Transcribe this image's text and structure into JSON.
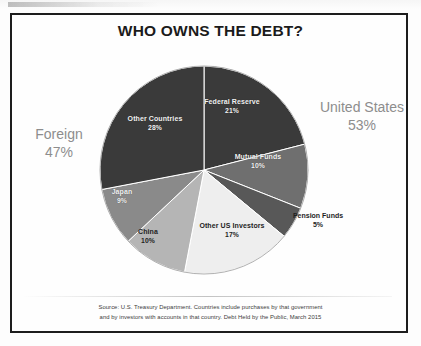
{
  "figure": {
    "title": "WHO OWNS THE DEBT?",
    "source_line1": "Source: U.S. Treasury Department. Countries include purchases by that government",
    "source_line2": "and by investors with accounts in that country. Debt Held by the Public, March 2015"
  },
  "groups": [
    {
      "name": "United States",
      "label": "United States",
      "pct": "53%",
      "color": "#8d8d8d"
    },
    {
      "name": "Foreign",
      "label": "Foreign",
      "pct": "47%",
      "color": "#8d8d8d"
    }
  ],
  "chart_data": {
    "type": "pie",
    "title": "WHO OWNS THE DEBT?",
    "units": "percent of debt held by the public",
    "start_angle_deg": 0,
    "direction": "clockwise",
    "legend": "none (labels placed on slices)",
    "categories": [
      "Federal Reserve",
      "Mutual Funds",
      "Pension Funds",
      "Other US Investors",
      "China",
      "Japan",
      "Other Countries"
    ],
    "values": [
      21,
      10,
      5,
      17,
      10,
      9,
      28
    ],
    "slices": [
      {
        "label": "Federal Reserve",
        "pct": "21%",
        "value": 21,
        "color": "#3b3b3b",
        "group": "United States",
        "label_color": "light"
      },
      {
        "label": "Mutual Funds",
        "pct": "10%",
        "value": 10,
        "color": "#6f6f6f",
        "group": "United States",
        "label_color": "light"
      },
      {
        "label": "Pension Funds",
        "pct": "5%",
        "value": 5,
        "color": "#595959",
        "group": "United States",
        "label_color": "dark"
      },
      {
        "label": "Other US Investors",
        "pct": "17%",
        "value": 17,
        "color": "#ececec",
        "group": "United States",
        "label_color": "dark"
      },
      {
        "label": "China",
        "pct": "10%",
        "value": 10,
        "color": "#b4b4b4",
        "group": "Foreign",
        "label_color": "dark"
      },
      {
        "label": "Japan",
        "pct": "9%",
        "value": 9,
        "color": "#8a8a8a",
        "group": "Foreign",
        "label_color": "light"
      },
      {
        "label": "Other Countries",
        "pct": "28%",
        "value": 28,
        "color": "#3b3b3b",
        "group": "Foreign",
        "label_color": "light"
      }
    ],
    "group_totals": [
      {
        "name": "United States",
        "pct": "53%",
        "value": 53
      },
      {
        "name": "Foreign",
        "pct": "47%",
        "value": 47
      }
    ]
  }
}
